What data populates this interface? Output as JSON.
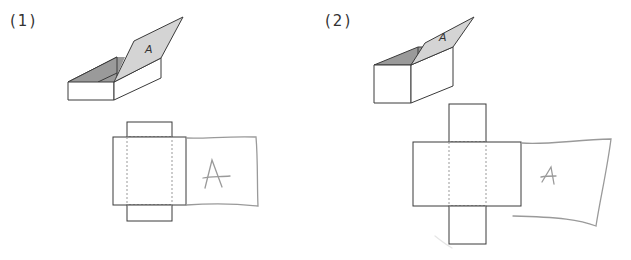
{
  "problems": [
    {
      "label": "(1)",
      "box_type": "short-box",
      "lid_label": "A",
      "net_label": "A"
    },
    {
      "label": "(2)",
      "box_type": "tall-box",
      "lid_label": "A",
      "net_label": "A"
    }
  ],
  "colors": {
    "line": "#3a3a3a",
    "lid_fill": "#d4d4d4",
    "inner_fill": "#9a9a9a",
    "dashed": "#999999",
    "hand": "#9a9a9a"
  }
}
